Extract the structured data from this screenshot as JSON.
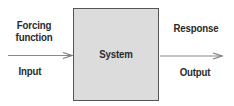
{
  "diagram": {
    "type": "block-diagram",
    "system_box": {
      "label": "System",
      "fill": "#dcdcdc",
      "border": "#555555"
    },
    "left": {
      "top_label": [
        "Forcing",
        "function"
      ],
      "bottom_label": "Input"
    },
    "right": {
      "top_label": "Response",
      "bottom_label": "Output"
    },
    "arrow_color": "#777777",
    "text_color": "#2a2a2a"
  }
}
